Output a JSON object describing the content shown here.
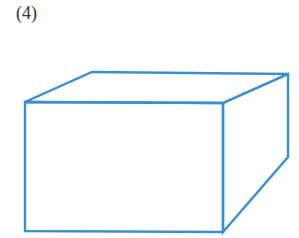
{
  "figure": {
    "label": "(4)",
    "shape": "rectangular-prism-wireframe",
    "stroke_color": "#3a8fd0",
    "stroke_width": 2.4,
    "vertices": {
      "front_top_left": [
        25,
        102
      ],
      "front_top_right": [
        223,
        103
      ],
      "front_bottom_left": [
        25,
        231
      ],
      "front_bottom_right": [
        223,
        232
      ],
      "back_top_left": [
        92,
        72
      ],
      "back_top_right": [
        288,
        74
      ],
      "back_bottom_right": [
        288,
        157
      ]
    }
  }
}
